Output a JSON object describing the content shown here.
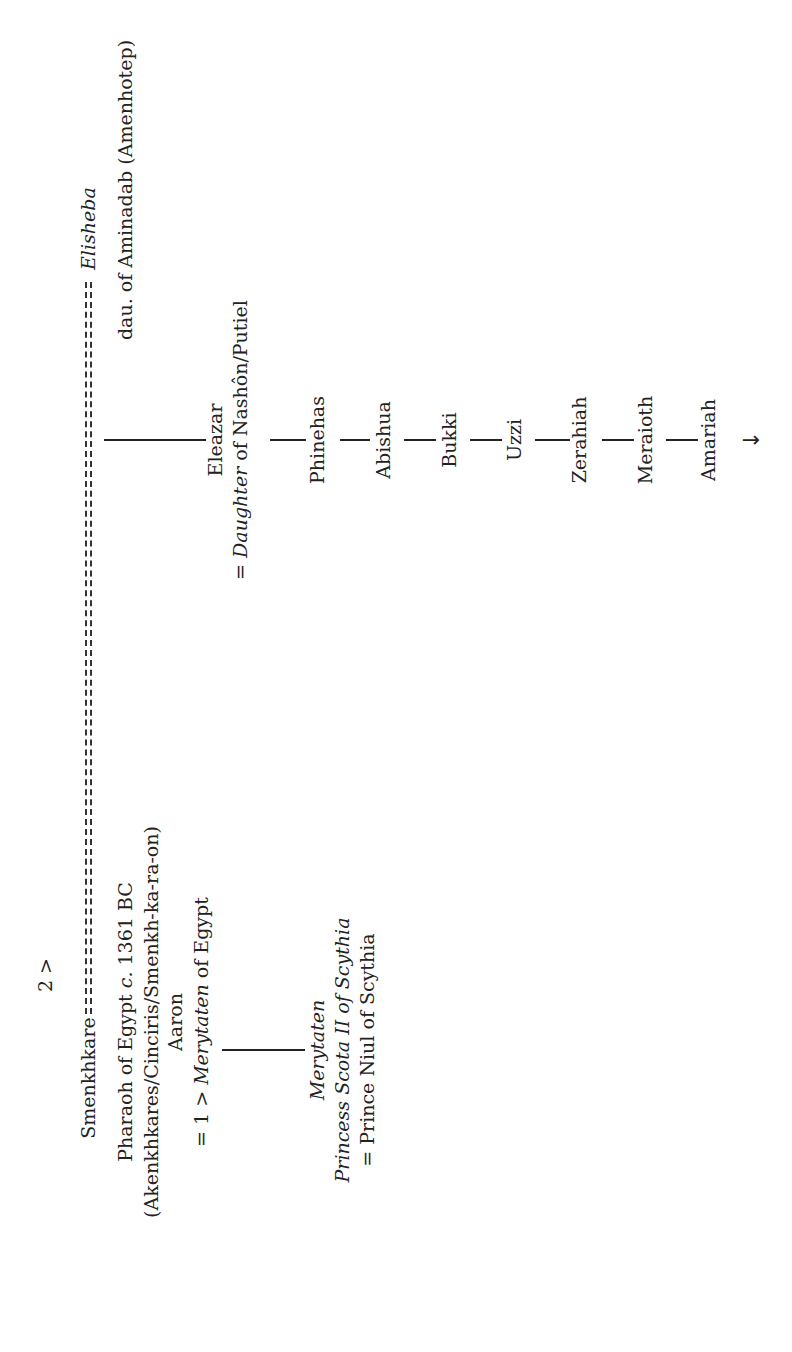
{
  "page": {
    "orientation": "rotated-90-ccw",
    "continuation_marker": "2 >"
  },
  "couple": {
    "husband": {
      "name": "Smenkhkare",
      "title_prefix": "Pharaoh of Egypt ",
      "title_c": "c.",
      "title_date": " 1361 BC",
      "aliases": "(Akenkhkares/Cinciris/Smenkh-ka-ra-on)",
      "alt_name": "Aaron",
      "spouse1_prefix": "= 1 > ",
      "spouse1_name": "Merytaten",
      "spouse1_suffix": " of Egypt"
    },
    "marriage_connector": "=========================================================",
    "wife": {
      "name": "Elisheba",
      "parent": "dau. of Aminadab (Amenhotep)"
    }
  },
  "branch_merytaten": {
    "name": "Merytaten",
    "title": "Princess Scota II of Scythia",
    "spouse": "= Prince Niul of Scythia"
  },
  "branch_eleazar": {
    "name": "Eleazar",
    "spouse_prefix": "= ",
    "spouse_italic": "Daughter",
    "spouse_suffix": " of Nashôn/Putiel",
    "descendants": [
      "Phinehas",
      "Abishua",
      "Bukki",
      "Uzzi",
      "Zerahiah",
      "Meraioth",
      "Amariah"
    ],
    "continues_icon": "arrow-right-icon",
    "continues_glyph": "→"
  },
  "colors": {
    "text": "#222222",
    "background": "#ffffff"
  }
}
